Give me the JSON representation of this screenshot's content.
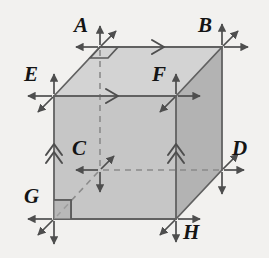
{
  "figure": {
    "kind": "geometry-diagram",
    "canvas": {
      "width": 269,
      "height": 258
    },
    "background_color": "#f2f1ef",
    "stroke_color": "#5a5a5a",
    "label_color": "#141414",
    "face_fill_front": "#c9c9c9",
    "face_fill_top": "#d6d6d6",
    "face_fill_right": "#b4b4b4",
    "hidden_line_style": "dashed"
  },
  "vertices": [
    {
      "id": "A",
      "label": "A",
      "x": 100,
      "y": 47,
      "label_x": 74,
      "label_y": 15,
      "hidden": false,
      "arrows": [
        "up",
        "up-right",
        "left"
      ]
    },
    {
      "id": "B",
      "label": "B",
      "x": 222,
      "y": 47,
      "label_x": 198,
      "label_y": 15,
      "hidden": false,
      "arrows": [
        "up",
        "up-right",
        "right"
      ]
    },
    {
      "id": "E",
      "label": "E",
      "x": 54,
      "y": 96,
      "label_x": 24,
      "label_y": 64,
      "hidden": false,
      "arrows": [
        "up",
        "left",
        "down-left"
      ]
    },
    {
      "id": "F",
      "label": "F",
      "x": 176,
      "y": 96,
      "label_x": 152,
      "label_y": 64,
      "hidden": false,
      "arrows": [
        "up",
        "right",
        "down-left"
      ]
    },
    {
      "id": "C",
      "label": "C",
      "x": 100,
      "y": 170,
      "label_x": 72,
      "label_y": 138,
      "hidden": true,
      "arrows": [
        "left",
        "down",
        "up-right"
      ]
    },
    {
      "id": "D",
      "label": "D",
      "x": 222,
      "y": 170,
      "label_x": 232,
      "label_y": 138,
      "hidden": false,
      "arrows": [
        "up-right",
        "right",
        "down"
      ]
    },
    {
      "id": "G",
      "label": "G",
      "x": 54,
      "y": 219,
      "label_x": 24,
      "label_y": 186,
      "hidden": false,
      "arrows": [
        "left",
        "down",
        "down-left"
      ]
    },
    {
      "id": "H",
      "label": "H",
      "x": 176,
      "y": 219,
      "label_x": 183,
      "label_y": 222,
      "hidden": false,
      "arrows": [
        "right",
        "down",
        "down-left"
      ]
    }
  ],
  "edges": [
    {
      "id": "AB",
      "from": "A",
      "to": "B",
      "hidden": false,
      "tick": "single-chevron-right"
    },
    {
      "id": "EF",
      "from": "E",
      "to": "F",
      "hidden": false,
      "tick": "single-chevron-right"
    },
    {
      "id": "AE",
      "from": "A",
      "to": "E",
      "hidden": false,
      "tick": "none"
    },
    {
      "id": "BF",
      "from": "B",
      "to": "F",
      "hidden": false,
      "tick": "none"
    },
    {
      "id": "EG",
      "from": "E",
      "to": "G",
      "hidden": false,
      "tick": "double-chevron-up"
    },
    {
      "id": "FH",
      "from": "F",
      "to": "H",
      "hidden": false,
      "tick": "double-chevron-up"
    },
    {
      "id": "BD",
      "from": "B",
      "to": "D",
      "hidden": false,
      "tick": "none"
    },
    {
      "id": "GH",
      "from": "G",
      "to": "H",
      "hidden": false,
      "tick": "none"
    },
    {
      "id": "DH",
      "from": "D",
      "to": "H",
      "hidden": false,
      "tick": "none"
    },
    {
      "id": "AC",
      "from": "A",
      "to": "C",
      "hidden": true,
      "tick": "none"
    },
    {
      "id": "CD",
      "from": "C",
      "to": "D",
      "hidden": true,
      "tick": "none"
    },
    {
      "id": "CG",
      "from": "C",
      "to": "G",
      "hidden": true,
      "tick": "none"
    }
  ],
  "angle_markers": [
    {
      "id": "angle-at-A",
      "at": "A",
      "shape": "parallelogram",
      "note": "right-angle mark in perspective"
    },
    {
      "id": "angle-at-G",
      "at": "G",
      "shape": "square",
      "note": "right-angle mark"
    }
  ]
}
